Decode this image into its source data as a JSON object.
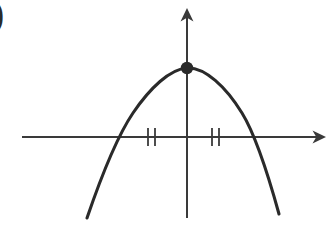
{
  "figure": {
    "label": ")",
    "background_color": "#ffffff",
    "stroke_color": "#2a2a2a",
    "axis_color": "#3a3a3a",
    "curve_width": 3.1,
    "axis_width": 2.0,
    "tick_width": 1.8
  },
  "axes": {
    "x_axis": {
      "name": "x-axis",
      "y": 137,
      "x_start": 22,
      "x_end": 318,
      "arrow": "right",
      "arrow_tip_x": 326,
      "arrow_size": 9
    },
    "y_axis": {
      "name": "y-axis",
      "x": 187,
      "y_start": 16,
      "y_end": 218,
      "arrow": "up",
      "arrow_tip_y": 8,
      "arrow_size": 9
    },
    "origin": {
      "x": 187,
      "y": 137
    }
  },
  "tick_marks": {
    "description": "congruence hash marks on x-axis",
    "half_height": 9,
    "left_pair": [
      148,
      155
    ],
    "right_pair": [
      212,
      219
    ]
  },
  "vertex_point": {
    "name": "vertex-dot",
    "x": 187,
    "y": 68,
    "radius": 6.2,
    "filled": true,
    "color": "#2a2a2a"
  },
  "chart_data": {
    "type": "line",
    "title": "",
    "xlabel": "",
    "ylabel": "",
    "subtitle": "",
    "grid": false,
    "legend": "none",
    "curve_name": "downward parabola",
    "opens": "down",
    "vertex_pixel": [
      187,
      68
    ],
    "x_intercepts_pixel": [
      110,
      256
    ],
    "axis_symmetry_pixel_x": 187,
    "path_points": [
      [
        87,
        218
      ],
      [
        95,
        196
      ],
      [
        104,
        173
      ],
      [
        112,
        152
      ],
      [
        120,
        135
      ],
      [
        130,
        118
      ],
      [
        141,
        103
      ],
      [
        152,
        90
      ],
      [
        164,
        79
      ],
      [
        176,
        71
      ],
      [
        187,
        68
      ],
      [
        199,
        69
      ],
      [
        211,
        74
      ],
      [
        222,
        83
      ],
      [
        233,
        95
      ],
      [
        243,
        110
      ],
      [
        251,
        126
      ],
      [
        258,
        142
      ],
      [
        264,
        159
      ],
      [
        270,
        178
      ],
      [
        275,
        197
      ],
      [
        279,
        214
      ]
    ],
    "bezier_path": "M 87 218 C 100 180 116 138 133 113 C 150 88 170 69 187 68 C 205 67 226 87 242 113 C 258 139 271 185 279 214",
    "series": [
      {
        "name": "parabola",
        "x": [
          -3.0,
          -2.4,
          -1.8,
          -1.2,
          -0.6,
          0.0,
          0.6,
          1.2,
          1.8,
          2.4,
          3.0
        ],
        "values": [
          -5.0,
          -2.2,
          -0.1,
          1.4,
          2.2,
          2.45,
          2.2,
          1.4,
          -0.1,
          -2.2,
          -5.0
        ]
      }
    ],
    "xlim": [
      -3.4,
      3.4
    ],
    "ylim": [
      -5.5,
      3.2
    ]
  }
}
